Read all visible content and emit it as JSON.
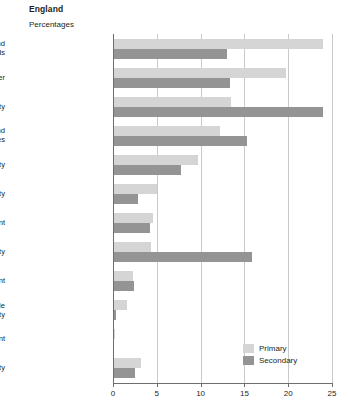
{
  "title": "England",
  "subtitle": "Percentages",
  "legend": {
    "primary_label": "Primary",
    "secondary_label": "Secondary"
  },
  "axis": {
    "ticks": [
      "0",
      "5",
      "10",
      "15",
      "20",
      "25"
    ]
  },
  "chart_data": {
    "type": "bar",
    "orientation": "horizontal",
    "grouped": true,
    "title": "England",
    "subtitle": "Percentages",
    "xlabel": "Percentages",
    "ylabel": "",
    "xlim": [
      0,
      25
    ],
    "xticks": [
      0,
      5,
      10,
      15,
      20,
      25
    ],
    "grid": true,
    "legend_position": "bottom-right",
    "categories": [
      "Speech, language and\ncommunication needs",
      "Autistic spectrum disorder",
      "Moderate learning difficulty",
      "Behaviour, emotional and\nsocial difficulties",
      "Physical disability",
      "Severe learning difficulty",
      "Hearing impairment",
      "Specific learning difficulty",
      "Visual impairment",
      "Profound and multiple\nlearning difficulty",
      "Multi-sensory impairment",
      "Other difficulty/disability"
    ],
    "series": [
      {
        "name": "Primary",
        "color": "#d5d5d5",
        "values": [
          24.0,
          19.8,
          13.5,
          12.2,
          9.7,
          5.0,
          4.6,
          4.3,
          2.3,
          1.6,
          0.2,
          3.2
        ]
      },
      {
        "name": "Secondary",
        "color": "#949494",
        "values": [
          13.0,
          13.3,
          24.0,
          15.3,
          7.8,
          2.9,
          4.2,
          15.9,
          2.4,
          0.3,
          0.15,
          2.5
        ]
      }
    ]
  }
}
